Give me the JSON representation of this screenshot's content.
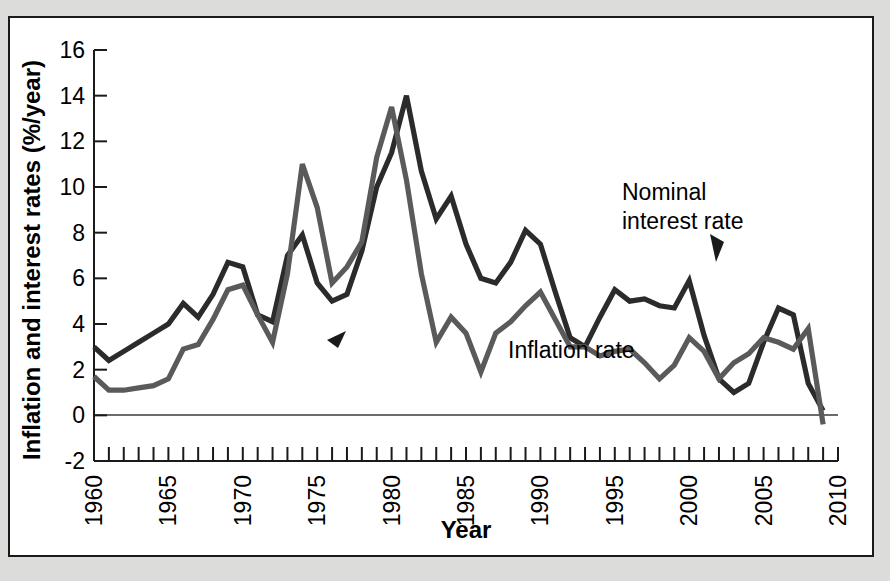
{
  "figure": {
    "background_color": "#dcdcda",
    "panel_color": "#ffffff",
    "frame_color": "#1a1a1a"
  },
  "chart_data": {
    "type": "line",
    "title": "",
    "subtitle": "",
    "xlabel": "Year",
    "ylabel": "Inflation and interest rates (%/year)",
    "xlim": [
      1960,
      2010
    ],
    "ylim": [
      -2,
      16
    ],
    "xticks": [
      1960,
      1961,
      1962,
      1963,
      1964,
      1965,
      1966,
      1967,
      1968,
      1969,
      1970,
      1971,
      1972,
      1973,
      1974,
      1975,
      1976,
      1977,
      1978,
      1979,
      1980,
      1981,
      1982,
      1983,
      1984,
      1985,
      1986,
      1987,
      1988,
      1989,
      1990,
      1991,
      1992,
      1993,
      1994,
      1995,
      1996,
      1997,
      1998,
      1999,
      2000,
      2001,
      2002,
      2003,
      2004,
      2005,
      2006,
      2007,
      2008,
      2009,
      2010
    ],
    "xtick_labels": [
      "1960",
      "1965",
      "1970",
      "1975",
      "1980",
      "1985",
      "1990",
      "1995",
      "2000",
      "2005",
      "2010"
    ],
    "xtick_label_values": [
      1960,
      1965,
      1970,
      1975,
      1980,
      1985,
      1990,
      1995,
      2000,
      2005,
      2010
    ],
    "yticks": [
      -2,
      0,
      2,
      4,
      6,
      8,
      10,
      12,
      14,
      16
    ],
    "ytick_labels": [
      "-2",
      "0",
      "2",
      "4",
      "6",
      "8",
      "10",
      "12",
      "14",
      "16"
    ],
    "grid": false,
    "legend_position": "inline-annotations",
    "zero_line": 0,
    "x": [
      1960,
      1961,
      1962,
      1963,
      1964,
      1965,
      1966,
      1967,
      1968,
      1969,
      1970,
      1971,
      1972,
      1973,
      1974,
      1975,
      1976,
      1977,
      1978,
      1979,
      1980,
      1981,
      1982,
      1983,
      1984,
      1985,
      1986,
      1987,
      1988,
      1989,
      1990,
      1991,
      1992,
      1993,
      1994,
      1995,
      1996,
      1997,
      1998,
      1999,
      2000,
      2001,
      2002,
      2003,
      2004,
      2005,
      2006,
      2007,
      2008,
      2009
    ],
    "series": [
      {
        "name": "Nominal interest rate",
        "color": "#2b2b2b",
        "label": "Nominal\ninterest rate",
        "label_line_1": "Nominal",
        "label_line_2": "interest rate",
        "values": [
          3.0,
          2.4,
          2.8,
          3.2,
          3.6,
          4.0,
          4.9,
          4.3,
          5.3,
          6.7,
          6.5,
          4.4,
          4.1,
          7.0,
          7.9,
          5.8,
          5.0,
          5.3,
          7.2,
          10.0,
          11.5,
          14.0,
          10.7,
          8.6,
          9.6,
          7.5,
          6.0,
          5.8,
          6.7,
          8.1,
          7.5,
          5.4,
          3.4,
          3.0,
          4.3,
          5.5,
          5.0,
          5.1,
          4.8,
          4.7,
          5.9,
          3.5,
          1.6,
          1.0,
          1.4,
          3.2,
          4.7,
          4.4,
          1.4,
          0.2
        ]
      },
      {
        "name": "Inflation rate",
        "color": "#5a5a5a",
        "label": "Inflation rate",
        "values": [
          1.7,
          1.1,
          1.1,
          1.2,
          1.3,
          1.6,
          2.9,
          3.1,
          4.2,
          5.5,
          5.7,
          4.4,
          3.2,
          6.2,
          11.0,
          9.1,
          5.8,
          6.5,
          7.6,
          11.3,
          13.5,
          10.3,
          6.2,
          3.2,
          4.3,
          3.6,
          1.9,
          3.6,
          4.1,
          4.8,
          5.4,
          4.2,
          3.0,
          3.0,
          2.6,
          2.8,
          2.9,
          2.3,
          1.6,
          2.2,
          3.4,
          2.8,
          1.6,
          2.3,
          2.7,
          3.4,
          3.2,
          2.9,
          3.8,
          -0.4
        ]
      }
    ],
    "annotations": [
      {
        "text": "Nominal interest rate",
        "x": 1999,
        "y": 7.6
      },
      {
        "text": "Inflation rate",
        "x": 1991,
        "y": 1.9
      }
    ]
  }
}
